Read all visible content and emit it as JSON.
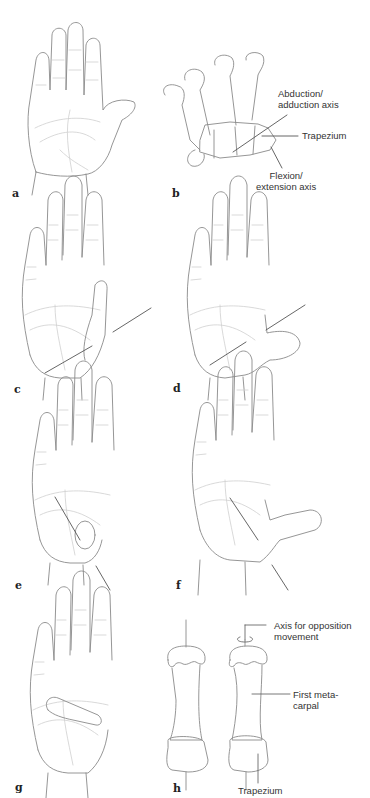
{
  "figure": {
    "panels": [
      {
        "id": "a",
        "label": "a",
        "depiction": "open hand, palm view, thumb abducted"
      },
      {
        "id": "b",
        "label": "b",
        "depiction": "hand skeleton with carpometacarpal joint axes",
        "annotations": [
          "Abduction/\nadduction axis",
          "Trapezium",
          "Flexion/\nextension axis"
        ]
      },
      {
        "id": "c",
        "label": "c",
        "depiction": "hand with thumb adducted, axis line drawn"
      },
      {
        "id": "d",
        "label": "d",
        "depiction": "hand with thumb flexed across palm, axis line drawn"
      },
      {
        "id": "e",
        "label": "e",
        "depiction": "hand with thumb in opposition, axis line drawn"
      },
      {
        "id": "f",
        "label": "f",
        "depiction": "hand with thumb extended, axis line drawn"
      },
      {
        "id": "g",
        "label": "g",
        "depiction": "hand with thumb folded across palm"
      },
      {
        "id": "h",
        "label": "h",
        "depiction": "first metacarpal and trapezium, two rotational positions",
        "annotations": [
          "Axis for opposition\nmovement",
          "First meta-\ncarpal",
          "Trapezium"
        ]
      }
    ]
  },
  "labels": {
    "a": "a",
    "b": "b",
    "c": "c",
    "d": "d",
    "e": "e",
    "f": "f",
    "g": "g",
    "h": "h"
  },
  "annotations": {
    "abduction_axis": "Abduction/\nadduction axis",
    "trapezium_b": "Trapezium",
    "flexion_axis": "Flexion/\nextension axis",
    "opposition_axis": "Axis for opposition\nmovement",
    "first_metacarpal": "First meta-\ncarpal",
    "trapezium_h": "Trapezium"
  },
  "colors": {
    "outline": "#8a8a8a",
    "crease": "#c4c4c4",
    "axis_line": "#555555",
    "text": "#333333"
  }
}
